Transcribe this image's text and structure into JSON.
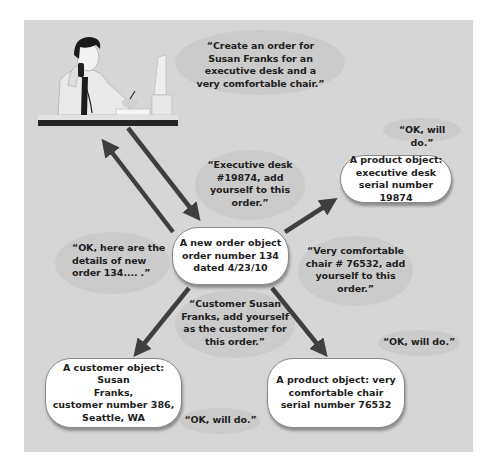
{
  "diagram": {
    "background_color": "#d6d6d6",
    "arrow_color": "#3f3f3f",
    "actor": {
      "description": "office worker on phone at desk with computer"
    },
    "nodes": {
      "order": {
        "label": "A new order object\norder number 134\ndated 4/23/10"
      },
      "desk_product": {
        "label": "A product object:\nexecutive desk\nserial number 19874"
      },
      "customer": {
        "label": "A customer object: Susan\nFranks,\ncustomer number 386,\nSeattle, WA"
      },
      "chair_product": {
        "label": "A product object: very\ncomfortable chair\nserial number 76532"
      }
    },
    "messages": {
      "create_order": "“Create an order for\nSusan Franks for an\nexecutive desk and a\nvery comfortable chair.”",
      "order_details": "“OK, here are the\ndetails of new\norder 134.... .”",
      "add_desk": "“Executive desk\n#19874, add\nyourself to this\norder.”",
      "desk_ok": "“OK, will do.”",
      "add_chair": "“Very comfortable\nchair # 76532, add\nyourself to this\norder.”",
      "chair_ok": "“OK, will do.”",
      "add_customer": "“Customer Susan\nFranks, add yourself\nas the customer for\nthis order.”",
      "customer_ok": "“OK, will do.”"
    },
    "arrows": [
      {
        "from": "actor",
        "to": "order"
      },
      {
        "from": "order",
        "to": "actor"
      },
      {
        "from": "order",
        "to": "desk_product"
      },
      {
        "from": "order",
        "to": "customer"
      },
      {
        "from": "order",
        "to": "chair_product"
      }
    ]
  }
}
